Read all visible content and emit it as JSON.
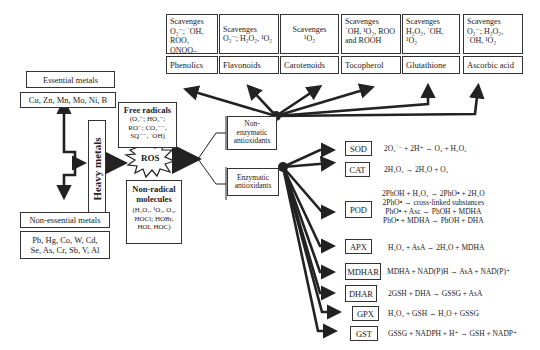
{
  "metals": {
    "essential_title": "Essential metals",
    "essential_list": "Cu, Zn, Mn, Mo, Ni, B",
    "nonessential_title": "Non-essential metals",
    "nonessential_list": "Pb, Hg, Co, W, Cd,\nSe, As, Cr, Sb, V, Al",
    "heavy": "Heavy metals"
  },
  "ros": {
    "label": "ROS",
    "free_radicals_title": "Free radicals",
    "free_radicals_list": "(O₂⁻; HO₂⁻;\nRO⁻; CO₃⁻⁻,\nSQ⁻⁻, ˙OH)",
    "non_radical_title": "Non-radical\nmolecules",
    "non_radical_list": "(H₂O₂, ¹O₂, O₃,\nHOCl; HOBr,\nHOI, HOC)"
  },
  "antioxidants": {
    "non_enzymatic": "Non-\nenzymatic\nantioxidants",
    "enzymatic": "Enzymatic\nantioxidants"
  },
  "non_enzymatic_items": [
    {
      "name": "Phenolics",
      "scavenges": "Scavenges\nO₂⁻; ˙OH,\nROO, ONOO–"
    },
    {
      "name": "Flavonoids",
      "scavenges": "Scavenges\nO₂⁻; H₂O₂, ¹O₂"
    },
    {
      "name": "Carotenoids",
      "scavenges": "Scavenges\n¹O₂"
    },
    {
      "name": "Tocopherol",
      "scavenges": "Scavenges\n˙OH, ¹O₂, ROO\nand ROOH"
    },
    {
      "name": "Glutathione",
      "scavenges": "Scavenges\nH₂O₂, ˙OH,\n¹O₂"
    },
    {
      "name": "Ascorbic acid",
      "scavenges": "Scavenges\nO₂⁻; H₂O₂,\n˙OH, ¹O₂"
    }
  ],
  "enzymes": [
    {
      "name": "SOD",
      "reaction": "2O₂˙⁻ + 2H⁺ → O₂ + H₂O₂"
    },
    {
      "name": "CAT",
      "reaction": "2H₂O₂ → 2H₂O + O₂"
    },
    {
      "name": "POD",
      "reaction": "2PhOH + H₂O₂ → 2PhO• + 2H₂O\n2PhO• → cross-linked substances\nPhO• + Asc → PhOH + MDHA\nPhO• + MDHA → PhOH + DHA"
    },
    {
      "name": "APX",
      "reaction": "H₂O₂ + AsA → 2H₂O + MDHA"
    },
    {
      "name": "MDHAR",
      "reaction": "MDHA + NAD(P)H → AsA + NAD(P)⁺"
    },
    {
      "name": "DHAR",
      "reaction": "2GSH + DHA → GSSG + AsA"
    },
    {
      "name": "GPX",
      "reaction": "H₂O₂ + GSH → H₂O + GSSG"
    },
    {
      "name": "GST",
      "reaction": "GSSG + NADPH + H⁺ → GSH + NADP⁺"
    }
  ]
}
